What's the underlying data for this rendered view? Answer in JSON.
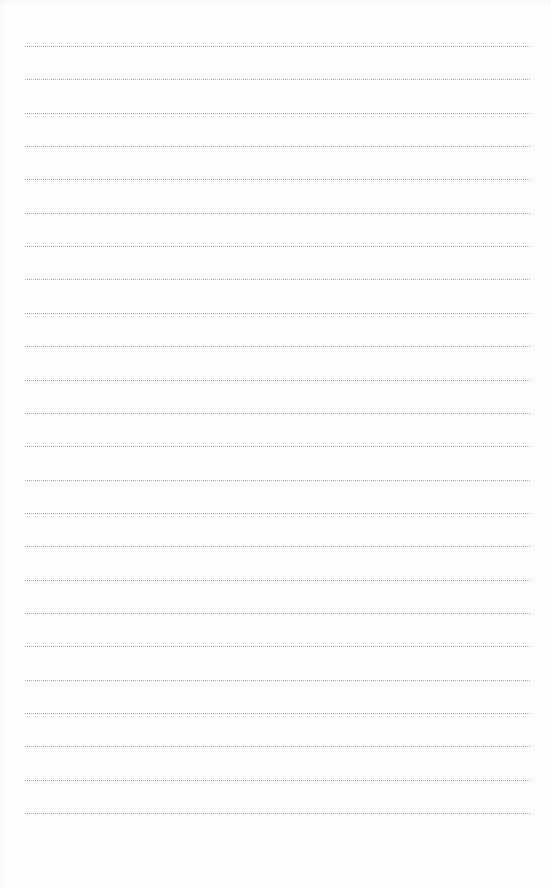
{
  "document": {
    "type": "lined-paper",
    "background_color": "#fefefe",
    "line_color": "#a8a8a8",
    "line_style": "dotted",
    "line_count": 24,
    "first_line_y": 46,
    "line_spacing": 33.35,
    "line_left": 25,
    "line_right": 530,
    "text_content": []
  }
}
